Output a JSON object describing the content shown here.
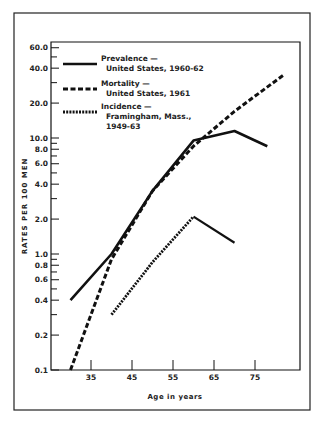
{
  "chart_data": {
    "type": "line",
    "title": "",
    "xlabel": "Age in years",
    "ylabel": "RATES PER 100 MEN",
    "yscale": "log",
    "xlim": [
      25,
      86
    ],
    "ylim": [
      0.1,
      70
    ],
    "grid": false,
    "legend_position": "upper-left",
    "x_ticks": [
      35,
      45,
      55,
      65,
      75
    ],
    "y_ticks": [
      {
        "value": 0.1,
        "label": "0.1"
      },
      {
        "value": 0.2,
        "label": "0.2"
      },
      {
        "value": 0.3,
        "label": ""
      },
      {
        "value": 0.4,
        "label": "0.4"
      },
      {
        "value": 0.5,
        "label": ""
      },
      {
        "value": 0.6,
        "label": "0.6"
      },
      {
        "value": 0.7,
        "label": ""
      },
      {
        "value": 0.8,
        "label": "0.8"
      },
      {
        "value": 0.9,
        "label": ""
      },
      {
        "value": 1.0,
        "label": "1.0"
      },
      {
        "value": 2.0,
        "label": "2.0"
      },
      {
        "value": 3.0,
        "label": ""
      },
      {
        "value": 4.0,
        "label": "4.0"
      },
      {
        "value": 5.0,
        "label": ""
      },
      {
        "value": 6.0,
        "label": "6.0"
      },
      {
        "value": 7.0,
        "label": ""
      },
      {
        "value": 8.0,
        "label": "8.0"
      },
      {
        "value": 9.0,
        "label": ""
      },
      {
        "value": 10.0,
        "label": "10.0"
      },
      {
        "value": 20.0,
        "label": "20.0"
      },
      {
        "value": 30.0,
        "label": ""
      },
      {
        "value": 40.0,
        "label": "40.0"
      },
      {
        "value": 50.0,
        "label": ""
      },
      {
        "value": 60.0,
        "label": "60.0"
      }
    ],
    "series": [
      {
        "name": "Prevalence — United States, 1960-62",
        "legend_line1": "Prevalence —",
        "legend_line2": "United States, 1960-62",
        "legend_line3": "",
        "style": "solid",
        "x": [
          30,
          40,
          50,
          60,
          70,
          78
        ],
        "values": [
          0.4,
          1.0,
          3.5,
          9.5,
          11.5,
          8.5
        ]
      },
      {
        "name": "Mortality — United States, 1961",
        "legend_line1": "Mortality —",
        "legend_line2": "United States, 1961",
        "legend_line3": "",
        "style": "dashed",
        "x": [
          30,
          40,
          50,
          60,
          70,
          82
        ],
        "values": [
          0.1,
          0.9,
          3.5,
          8.5,
          17,
          35
        ]
      },
      {
        "name": "Incidence — Framingham, Mass., 1949-63",
        "legend_line1": "Incidence —",
        "legend_line2": "Framingham, Mass.,",
        "legend_line3": "1949-63",
        "style": "dotted",
        "x": [
          40,
          50,
          60,
          70
        ],
        "values": [
          0.3,
          0.85,
          2.1,
          1.25
        ]
      }
    ]
  },
  "layout": {
    "plot_left": 51,
    "plot_right": 300,
    "plot_top": 42,
    "plot_bottom": 370,
    "x_ref_age": 35,
    "x_ref_px": 91,
    "px_per_year": 4.1,
    "px_per_decade": 116,
    "ink_color": "#111111"
  }
}
